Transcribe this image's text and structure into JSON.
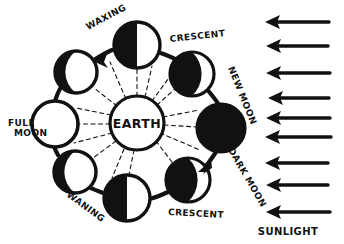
{
  "diagram": {
    "center_label": "EARTH",
    "style": "hand-drawn ink sketch, black on white",
    "colors": {
      "ink": "#111111",
      "paper": "#ffffff",
      "lit_moon": "#ffffff",
      "dark_moon": "#111111"
    },
    "orbit": {
      "center_x": 137,
      "center_y": 123,
      "radius": 83,
      "direction_labels": [
        "WAXING",
        "WANING"
      ]
    },
    "earth": {
      "label": "EARTH",
      "cx": 137,
      "cy": 123,
      "r": 27
    },
    "moons": [
      {
        "id": "first-quarter-top",
        "phase": "first quarter",
        "label": "",
        "cx": 137,
        "cy": 45,
        "r": 23,
        "shading": "left-half-dark"
      },
      {
        "id": "crescent-upper-right",
        "phase": "waxing crescent",
        "label": "CRESCENT",
        "cx": 192,
        "cy": 74,
        "r": 22,
        "shading": "mostly-dark-right-crescent-lit"
      },
      {
        "id": "new-moon-right",
        "phase": "new moon",
        "label": "NEW MOON",
        "cx": 221,
        "cy": 128,
        "r": 24,
        "shading": "full-dark"
      },
      {
        "id": "crescent-lower-right",
        "phase": "waning crescent",
        "label": "CRESCENT",
        "cx": 188,
        "cy": 180,
        "r": 22,
        "shading": "mostly-dark-right-crescent-lit"
      },
      {
        "id": "third-quarter-bottom",
        "phase": "third quarter",
        "label": "",
        "cx": 127,
        "cy": 198,
        "r": 23,
        "shading": "left-half-dark"
      },
      {
        "id": "gibbous-lower-left",
        "phase": "waning gibbous",
        "label": "",
        "cx": 75,
        "cy": 172,
        "r": 21,
        "shading": "left-crescent-dark"
      },
      {
        "id": "full-moon-left",
        "phase": "full moon",
        "label": "FULL MOON",
        "cx": 55,
        "cy": 124,
        "r": 23,
        "shading": "full-lit"
      },
      {
        "id": "gibbous-upper-left",
        "phase": "waxing gibbous",
        "label": "",
        "cx": 76,
        "cy": 72,
        "r": 21,
        "shading": "left-crescent-dark"
      }
    ],
    "labels": [
      {
        "id": "waxing",
        "text": "WAXING",
        "x": 88,
        "y": 30,
        "rotate": -28
      },
      {
        "id": "crescent-top",
        "text": "CRESCENT",
        "x": 170,
        "y": 42,
        "rotate": -6
      },
      {
        "id": "new-moon",
        "text": "NEW MOON",
        "x": 228,
        "y": 68,
        "rotate": 68
      },
      {
        "id": "dark-moon",
        "text": "DARK MOON",
        "x": 228,
        "y": 150,
        "rotate": 60
      },
      {
        "id": "crescent-bottom",
        "text": "CRESCENT",
        "x": 168,
        "y": 215,
        "rotate": 3
      },
      {
        "id": "waning",
        "text": "WANING",
        "x": 66,
        "y": 196,
        "rotate": 36
      },
      {
        "id": "full-moon",
        "text": "FULL MOON",
        "x": 8,
        "y": 126,
        "rotate": 0
      }
    ],
    "sunlight": {
      "label": "SUNLIGHT",
      "arrow_count": 9,
      "arrow_direction": "left",
      "arrows": [
        {
          "y": 22,
          "length": 58
        },
        {
          "y": 46,
          "length": 56
        },
        {
          "y": 73,
          "length": 58
        },
        {
          "y": 98,
          "length": 55
        },
        {
          "y": 118,
          "length": 58
        },
        {
          "y": 137,
          "length": 60
        },
        {
          "y": 163,
          "length": 57
        },
        {
          "y": 185,
          "length": 56
        },
        {
          "y": 212,
          "length": 58
        }
      ],
      "label_x": 288,
      "label_y": 234
    },
    "rays": {
      "description": "dashed lines from Earth to each moon",
      "style": "dashed",
      "count": 8
    }
  }
}
